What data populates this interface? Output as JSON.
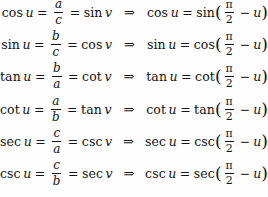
{
  "page": {
    "background_color": "#fefefe",
    "text_color": "#131313",
    "implies_symbol": "⇒",
    "equals_symbol": "=",
    "minus_symbol": "−",
    "open_paren": "(",
    "close_paren": ")",
    "pi_symbol": "π",
    "half_denominator": "2",
    "complement_angle_variable": "u"
  },
  "identities": [
    {
      "left": {
        "function": "cos",
        "angle": "u",
        "numerator": "a",
        "denominator": "c",
        "equivalent_function": "sin",
        "equivalent_angle": "v"
      },
      "right": {
        "function": "cos",
        "angle": "u",
        "cofunction": "sin",
        "argument_numerator": "π",
        "argument_denominator": "2",
        "argument_minus_term": "u"
      }
    },
    {
      "left": {
        "function": "sin",
        "angle": "u",
        "numerator": "b",
        "denominator": "c",
        "equivalent_function": "cos",
        "equivalent_angle": "v"
      },
      "right": {
        "function": "sin",
        "angle": "u",
        "cofunction": "cos",
        "argument_numerator": "π",
        "argument_denominator": "2",
        "argument_minus_term": "u"
      }
    },
    {
      "left": {
        "function": "tan",
        "angle": "u",
        "numerator": "b",
        "denominator": "a",
        "equivalent_function": "cot",
        "equivalent_angle": "v"
      },
      "right": {
        "function": "tan",
        "angle": "u",
        "cofunction": "cot",
        "argument_numerator": "π",
        "argument_denominator": "2",
        "argument_minus_term": "u"
      }
    },
    {
      "left": {
        "function": "cot",
        "angle": "u",
        "numerator": "a",
        "denominator": "b",
        "equivalent_function": "tan",
        "equivalent_angle": "v"
      },
      "right": {
        "function": "cot",
        "angle": "u",
        "cofunction": "tan",
        "argument_numerator": "π",
        "argument_denominator": "2",
        "argument_minus_term": "u"
      }
    },
    {
      "left": {
        "function": "sec",
        "angle": "u",
        "numerator": "c",
        "denominator": "a",
        "equivalent_function": "csc",
        "equivalent_angle": "v"
      },
      "right": {
        "function": "sec",
        "angle": "u",
        "cofunction": "csc",
        "argument_numerator": "π",
        "argument_denominator": "2",
        "argument_minus_term": "u"
      }
    },
    {
      "left": {
        "function": "csc",
        "angle": "u",
        "numerator": "c",
        "denominator": "b",
        "equivalent_function": "sec",
        "equivalent_angle": "v"
      },
      "right": {
        "function": "csc",
        "angle": "u",
        "cofunction": "sec",
        "argument_numerator": "π",
        "argument_denominator": "2",
        "argument_minus_term": "u"
      }
    }
  ]
}
